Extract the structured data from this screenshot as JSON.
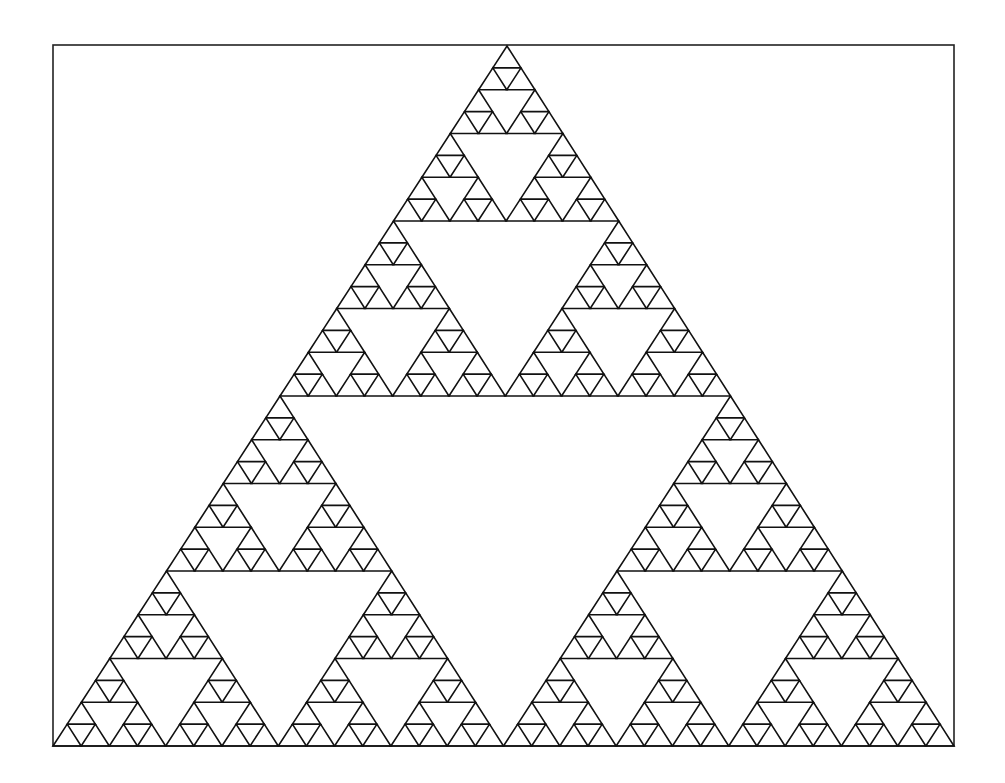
{
  "figure": {
    "type": "sierpinski-triangle",
    "depth": 5,
    "frame": {
      "x": 53,
      "y": 45,
      "width": 901,
      "height": 701
    },
    "vertices": {
      "left": [
        53,
        746
      ],
      "right": [
        954,
        746
      ],
      "top": [
        507,
        46
      ]
    },
    "stroke_color": "#111111",
    "background": "#ffffff"
  }
}
